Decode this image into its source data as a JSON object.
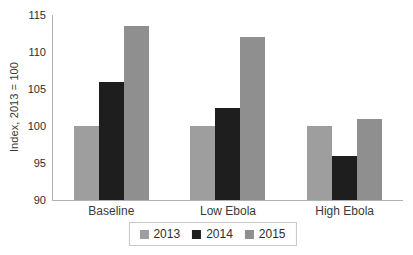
{
  "chart_data": {
    "type": "bar",
    "title": "",
    "categories": [
      "Baseline",
      "Low Ebola",
      "High Ebola"
    ],
    "series": [
      {
        "name": "2013",
        "color": "#9e9e9e",
        "values": [
          100,
          100,
          100
        ]
      },
      {
        "name": "2014",
        "color": "#1e1e1e",
        "values": [
          106,
          102.5,
          96
        ]
      },
      {
        "name": "2015",
        "color": "#8f8f8f",
        "values": [
          113.5,
          112,
          101
        ]
      }
    ],
    "xlabel": "",
    "ylabel": "Index, 2013 = 100",
    "ylim": [
      90,
      115
    ],
    "yticks": [
      90,
      95,
      100,
      105,
      110,
      115
    ],
    "grid": false,
    "legend_position": "bottom-center",
    "axis_color": "#b3b3b3",
    "text_color": "#2e2e2e"
  }
}
